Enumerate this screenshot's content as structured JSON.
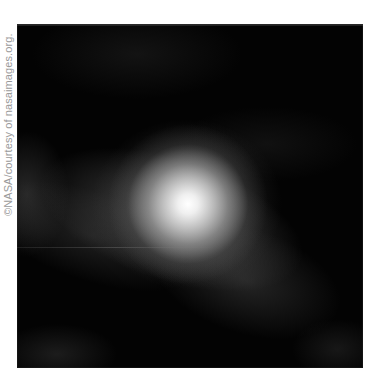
{
  "credit": {
    "text": "©NASA/courtesy of nasaimages.org."
  },
  "image": {
    "description": "Grayscale astronomical image of a diffuse glowing object on black background",
    "bright_core_color": "#ffffff",
    "background_color": "#030303"
  }
}
